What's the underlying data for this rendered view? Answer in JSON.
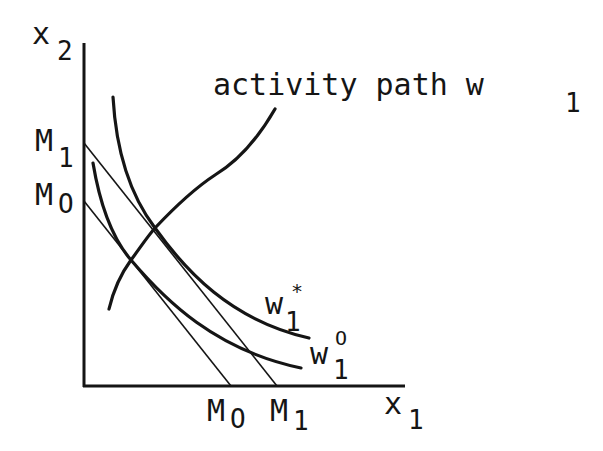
{
  "diagram": {
    "type": "economics-indifference-budget",
    "axes": {
      "x_label_base": "x",
      "x_label_sub": "1",
      "y_label_base": "x",
      "y_label_sub": "2"
    },
    "budget_lines": [
      {
        "id": "M1",
        "y_label_base": "M",
        "y_label_sub": "1",
        "x_label_base": "M",
        "x_label_sub": "1"
      },
      {
        "id": "M0",
        "y_label_base": "M",
        "y_label_sub": "O",
        "x_label_base": "M",
        "x_label_sub": "O"
      }
    ],
    "curves": [
      {
        "id": "w1_star",
        "label_base": "w",
        "label_sub": "1",
        "label_sup": "*"
      },
      {
        "id": "w1_zero",
        "label_base": "w",
        "label_sub": "1",
        "label_sup": "O"
      }
    ],
    "activity_path": {
      "label": "activity path w",
      "label_sub": "1"
    },
    "colors": {
      "ink": "#151515",
      "background": "#ffffff"
    }
  }
}
